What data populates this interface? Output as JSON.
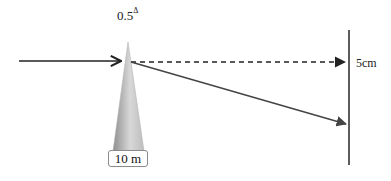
{
  "diagram": {
    "prism_power": "0.5",
    "prism_unit_symbol": "Δ",
    "distance_label": "10 m",
    "deviation_label": "5cm",
    "colors": {
      "line": "#222222",
      "dashed_line": "#222222",
      "deflected_ray": "#444444",
      "prism_dark": "#9a9a9a",
      "prism_light": "#e2e2e2",
      "box_border": "#8a8a8a"
    }
  }
}
